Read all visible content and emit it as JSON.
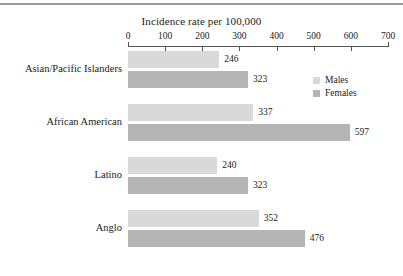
{
  "chart_data": {
    "type": "bar",
    "orientation": "horizontal",
    "title": "Incidence rate per 100,000",
    "xlabel": "",
    "ylabel": "",
    "xlim": [
      0,
      700
    ],
    "xticks": [
      0,
      100,
      200,
      300,
      400,
      500,
      600,
      700
    ],
    "grid": false,
    "legend_position": "top-right",
    "categories": [
      "Asian/Pacific Islanders",
      "African American",
      "Latino",
      "Anglo"
    ],
    "series": [
      {
        "name": "Males",
        "color": "#d9d9d9",
        "values": [
          246,
          337,
          240,
          352
        ]
      },
      {
        "name": "Females",
        "color": "#b4b4b4",
        "values": [
          323,
          597,
          323,
          476
        ]
      }
    ]
  },
  "legend": {
    "items": [
      {
        "label": "Males",
        "color": "#d9d9d9"
      },
      {
        "label": "Females",
        "color": "#b4b4b4"
      }
    ]
  }
}
